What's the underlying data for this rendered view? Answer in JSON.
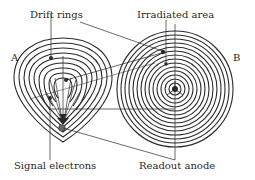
{
  "labels": {
    "drift_rings": "Drift rings",
    "irradiated_area": "Irradiated area",
    "signal_electrons": "Signal electrons",
    "readout_anode": "Readout anode",
    "view_a": "A",
    "view_b": "B"
  },
  "colors": {
    "stroke": "#2a2a2a",
    "background": "#ffffff"
  }
}
